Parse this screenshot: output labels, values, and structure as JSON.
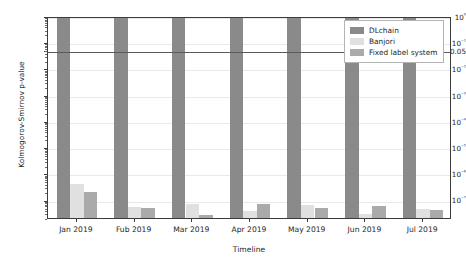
{
  "chart_data": {
    "type": "bar",
    "title": "",
    "xlabel": "Timeline",
    "ylabel": "Kolmogorov-Smirnov p-value",
    "yscale": "log",
    "ylim": [
      2e-08,
      1.0
    ],
    "grid": true,
    "legend_position": "upper right",
    "categories": [
      "Jan 2019",
      "Fub 2019",
      "Mar 2019",
      "Apr 2019",
      "May 2019",
      "Jun 2019",
      "Jul 2019"
    ],
    "ytick_labels": [
      "10⁰",
      "10⁻¹",
      "0.05",
      "10⁻²",
      "10⁻³",
      "10⁻⁴",
      "10⁻⁵",
      "10⁻⁶",
      "10⁻⁷"
    ],
    "ytick_values": [
      1.0,
      0.1,
      0.05,
      0.01,
      0.001,
      0.0001,
      1e-05,
      1e-06,
      1e-07
    ],
    "reference_line": {
      "label": "0.05",
      "value": 0.05
    },
    "series": [
      {
        "name": "DLchain",
        "color": "#8a8a8a",
        "values": [
          1.0,
          0.95,
          0.93,
          0.93,
          0.9,
          0.9,
          0.97
        ]
      },
      {
        "name": "Banjori",
        "color": "#e0e0e0",
        "values": [
          4e-07,
          5.2e-08,
          7e-08,
          3.8e-08,
          6.3e-08,
          2.8e-08,
          4.6e-08
        ]
      },
      {
        "name": "Fixed label system",
        "color": "#aaaaaa",
        "values": [
          1.9e-07,
          5e-08,
          2.7e-08,
          7e-08,
          5e-08,
          5.6e-08,
          4e-08
        ]
      }
    ]
  },
  "legend": {
    "items": [
      {
        "label": "DLchain"
      },
      {
        "label": "Banjori"
      },
      {
        "label": "Fixed label system"
      }
    ]
  }
}
